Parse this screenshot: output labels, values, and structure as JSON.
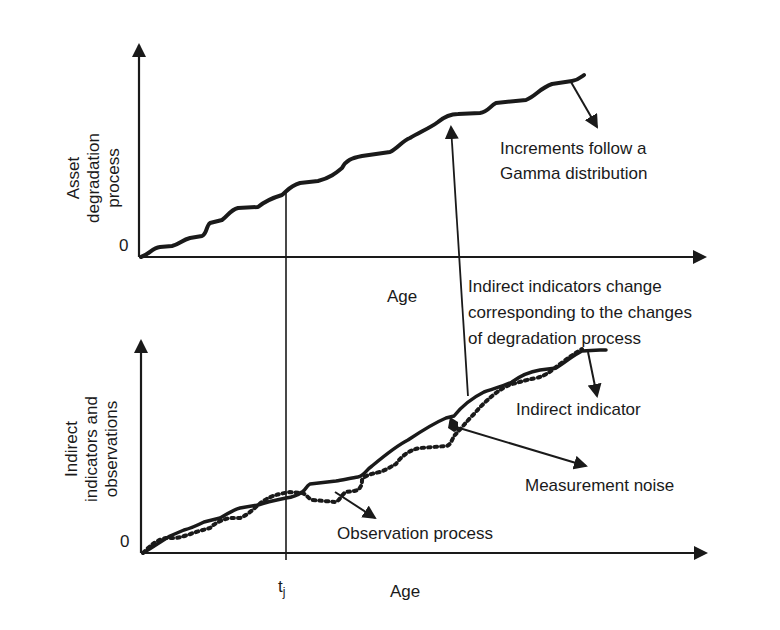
{
  "top_chart": {
    "y_label_lines": [
      "Asset",
      "degradation",
      "process"
    ],
    "x_label": "Age",
    "zero_label": "0",
    "annotation_lines": [
      "Increments follow a",
      "Gamma distribution"
    ]
  },
  "middle_annotation": {
    "lines": [
      "Indirect indicators change",
      "corresponding to the changes",
      "of degradation process"
    ]
  },
  "bottom_chart": {
    "y_label_lines": [
      "Indirect",
      "indicators and",
      "observations"
    ],
    "x_label": "Age",
    "zero_label": "0",
    "tick_label": "t",
    "tick_subscript": "j",
    "annotations": {
      "indirect_indicator": "Indirect indicator",
      "measurement_noise": "Measurement noise",
      "observation_process": "Observation process"
    }
  },
  "colors": {
    "line": "#1a1a1a",
    "background": "#ffffff"
  }
}
